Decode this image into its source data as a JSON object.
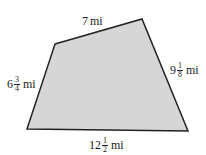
{
  "diagram": {
    "shape": "quadrilateral",
    "fill_color": "#d6d6d6",
    "stroke_color": "#222222",
    "vertices": [
      [
        55,
        44
      ],
      [
        142,
        19
      ],
      [
        188,
        131
      ],
      [
        27,
        129
      ]
    ],
    "sides": {
      "top": {
        "whole": "7",
        "num": "",
        "den": "",
        "unit": "mi"
      },
      "right": {
        "whole": "9",
        "num": "1",
        "den": "8",
        "unit": "mi"
      },
      "bottom": {
        "whole": "12",
        "num": "1",
        "den": "2",
        "unit": "mi"
      },
      "left": {
        "whole": "6",
        "num": "3",
        "den": "4",
        "unit": "mi"
      }
    }
  }
}
